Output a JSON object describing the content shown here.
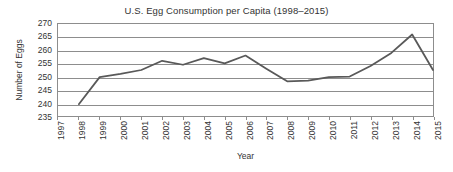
{
  "chart_data": {
    "type": "line",
    "title": "U.S. Egg Consumption per Capita (1998–2015)",
    "xlabel": "Year",
    "ylabel": "Number of Eggs",
    "grid": true,
    "legend_position": "none",
    "xlim": [
      1997,
      2015
    ],
    "ylim": [
      235,
      270
    ],
    "y_ticks": [
      270,
      265,
      260,
      255,
      250,
      245,
      240,
      235
    ],
    "x_ticks": [
      "1997",
      "1998",
      "1999",
      "2000",
      "2001",
      "2002",
      "2003",
      "2004",
      "2005",
      "2006",
      "2007",
      "2008",
      "2009",
      "2010",
      "2011",
      "2012",
      "2013",
      "2014",
      "2015"
    ],
    "x": [
      1998,
      1999,
      2000,
      2001,
      2002,
      2003,
      2004,
      2005,
      2006,
      2007,
      2008,
      2009,
      2010,
      2011,
      2012,
      2013,
      2014,
      2015
    ],
    "values": [
      239.5,
      249.8,
      251.0,
      252.5,
      256.0,
      254.5,
      257.0,
      255.0,
      258.0,
      253.0,
      248.2,
      248.5,
      249.8,
      250.0,
      254.0,
      259.0,
      266.0,
      252.5
    ],
    "series": [
      {
        "name": "Eggs per capita",
        "color": "#595959",
        "values": [
          239.5,
          249.8,
          251.0,
          252.5,
          256.0,
          254.5,
          257.0,
          255.0,
          258.0,
          253.0,
          248.2,
          248.5,
          249.8,
          250.0,
          254.0,
          259.0,
          266.0,
          252.5
        ]
      }
    ]
  },
  "colors": {
    "line": "#595959",
    "grid": "#8d8d8d",
    "frame": "#8d8d8d",
    "text": "#333333",
    "background": "#ffffff"
  }
}
